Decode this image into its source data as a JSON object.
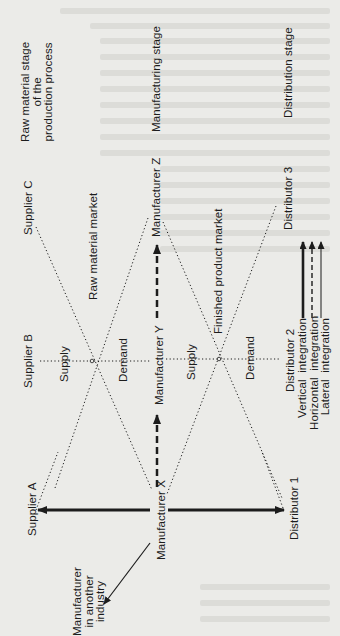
{
  "stages": {
    "raw_material": [
      "Raw material stage",
      "of the",
      "production process"
    ],
    "manufacturing": "Manufacturing stage",
    "distribution": "Distribution stage"
  },
  "suppliers": [
    "Supplier A",
    "Supplier B",
    "Supplier C"
  ],
  "manufacturers": [
    "Manufacturer X",
    "Manufacturer Y",
    "Manufacturer Z"
  ],
  "distributors": [
    "Distributor 1",
    "Distributor 2",
    "Distributor 3"
  ],
  "other_industry": [
    "Manufacturer",
    "in another",
    "industry"
  ],
  "markets": {
    "raw_material_market": "Raw material market",
    "finished_product_market": "Finished product market"
  },
  "curves": {
    "supply_1": "Supply",
    "demand_1": "Demand",
    "supply_2": "Supply",
    "demand_2": "Demand"
  },
  "legend": {
    "items": [
      {
        "label": "Vertical  integration",
        "style": "solid-thick"
      },
      {
        "label": "Horizontal  integration",
        "style": "dashed"
      },
      {
        "label": "Lateral  integration",
        "style": "solid-thin"
      }
    ]
  },
  "colors": {
    "background": "#ebebe8",
    "ink": "#1c1c1c"
  }
}
